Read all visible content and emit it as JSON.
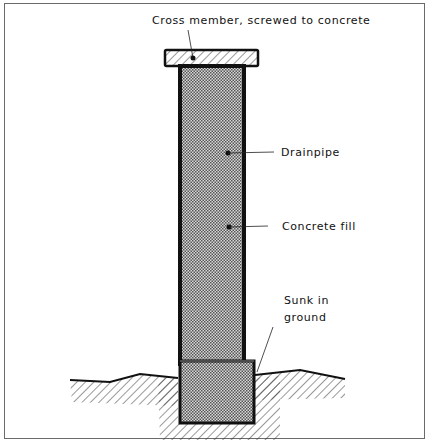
{
  "diagram": {
    "type": "cross-section",
    "labels": {
      "cross_member": "Cross member, screwed to concrete",
      "drainpipe": "Drainpipe",
      "concrete_fill": "Concrete fill",
      "sunk_line1": "Sunk in",
      "sunk_line2": "ground"
    },
    "colors": {
      "outline": "#111111",
      "hatch": "#333333",
      "crosshatch_dark": "#555555",
      "crosshatch_light": "#d8d8d8",
      "frame": "#6a6a6a"
    }
  }
}
